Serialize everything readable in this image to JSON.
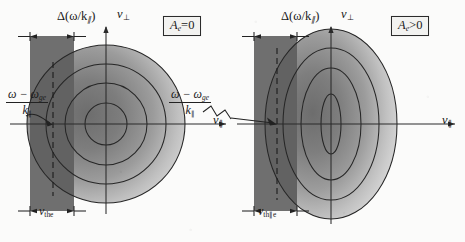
{
  "figure": {
    "kind": "velocity-space-contour-diagram",
    "background_color": "#fbfbfa",
    "ink_color": "#222222",
    "band_color": "#6e6e6e",
    "panel_count": 2
  },
  "panels": [
    {
      "id": "left",
      "anisotropy_label": "A",
      "anisotropy_sub": "e",
      "anisotropy_rel": "=0",
      "anisotropy_full": "A_e=0",
      "contour_shape": "circles",
      "description": "isotropic Maxwellian electron distribution",
      "band_width_label": "Δ(ω/k",
      "band_width_sub": "∥",
      "band_width_close": ")",
      "band_width_full": "Δ(ω/k∥)",
      "thermal_label": "v",
      "thermal_sub": "the",
      "thermal_full": "v_the",
      "resonance_num_a": "ω − ω",
      "resonance_num_sub": "ge",
      "resonance_den": "k",
      "resonance_den_sub": "∥",
      "resonance_full": "(ω − ω_ge)/k_∥",
      "axis_x": "v",
      "axis_x_sub": "∥",
      "axis_y": "v",
      "axis_y_sub": "⊥",
      "contours": [
        {
          "rx": 21,
          "ry": 21
        },
        {
          "rx": 41,
          "ry": 41
        },
        {
          "rx": 60,
          "ry": 60
        },
        {
          "rx": 79,
          "ry": 79
        }
      ]
    },
    {
      "id": "right",
      "anisotropy_label": "A",
      "anisotropy_sub": "e",
      "anisotropy_rel": ">0",
      "anisotropy_full": "A_e>0",
      "contour_shape": "ellipses",
      "description": "anisotropic distribution elongated along v-perpendicular",
      "band_width_label": "Δ(ω/k",
      "band_width_sub": "∥",
      "band_width_close": ")",
      "band_width_full": "Δ(ω/k∥)",
      "thermal_label": "v",
      "thermal_sub": "th∥e",
      "thermal_full": "v_th∥e",
      "resonance_num_a": "ω − ω",
      "resonance_num_sub": "ge",
      "resonance_den": "k",
      "resonance_den_sub": "∥",
      "resonance_full": "(ω − ω_ge)/k_∥",
      "axis_x": "v",
      "axis_x_sub": "∥",
      "axis_y": "v",
      "axis_y_sub": "⊥",
      "contours": [
        {
          "rx": 10,
          "ry": 30
        },
        {
          "rx": 30,
          "ry": 56
        },
        {
          "rx": 48,
          "ry": 76
        },
        {
          "rx": 66,
          "ry": 95
        }
      ]
    }
  ]
}
